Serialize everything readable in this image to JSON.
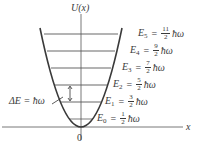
{
  "diagram": {
    "y_axis_label": "U(x)",
    "x_axis_label": "x",
    "origin_label": "0",
    "spacing_label": "ΔE = ħω",
    "colors": {
      "parabola": "#3a3a3a",
      "levels": "#9a9a9a",
      "axes": "#555555",
      "text": "#3a3a3a"
    },
    "levels": [
      {
        "name": "E",
        "n": "0",
        "numerator": "1",
        "denominator": "2",
        "unit": "ħω"
      },
      {
        "name": "E",
        "n": "1",
        "numerator": "3",
        "denominator": "2",
        "unit": "ħω"
      },
      {
        "name": "E",
        "n": "2",
        "numerator": "5",
        "denominator": "2",
        "unit": "ħω"
      },
      {
        "name": "E",
        "n": "3",
        "numerator": "7",
        "denominator": "2",
        "unit": "ħω"
      },
      {
        "name": "E",
        "n": "4",
        "numerator": "9",
        "denominator": "2",
        "unit": "ħω"
      },
      {
        "name": "E",
        "n": "5",
        "numerator": "11",
        "denominator": "2",
        "unit": "ħω"
      }
    ],
    "equals": "="
  }
}
